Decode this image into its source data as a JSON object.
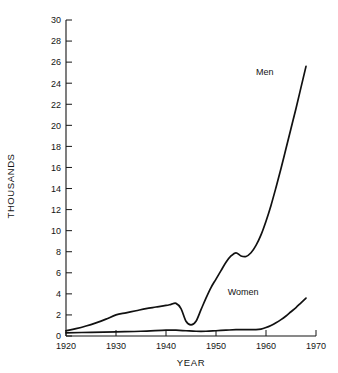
{
  "chart_data": {
    "type": "line",
    "title": "",
    "xlabel": "YEAR",
    "ylabel": "THOUSANDS",
    "xlim": [
      1920,
      1970
    ],
    "ylim": [
      0,
      30
    ],
    "grid": false,
    "legend_position": "inline-annotations",
    "xticks": [
      1920,
      1930,
      1940,
      1950,
      1960,
      1970
    ],
    "yticks": [
      0,
      2,
      4,
      6,
      8,
      10,
      12,
      14,
      16,
      18,
      20,
      22,
      24,
      26,
      28,
      30
    ],
    "xtick_labels": [
      "1920",
      "1930",
      "1940",
      "1950",
      "1960",
      "1970"
    ],
    "ytick_labels": [
      "0",
      "2",
      "4",
      "6",
      "8",
      "10",
      "12",
      "14",
      "16",
      "18",
      "20",
      "22",
      "24",
      "26",
      "28",
      "30"
    ],
    "annotations": [
      {
        "text": "Men",
        "x": 1961.5,
        "y": 24.8
      },
      {
        "text": "Women",
        "x": 1958.5,
        "y": 3.9
      }
    ],
    "series": [
      {
        "name": "Men",
        "x": [
          1920,
          1922,
          1924,
          1926,
          1928,
          1930,
          1932,
          1934,
          1936,
          1938,
          1940,
          1941,
          1942,
          1943,
          1944,
          1945,
          1946,
          1947,
          1948,
          1949,
          1950,
          1951,
          1952,
          1953,
          1954,
          1955,
          1956,
          1957,
          1958,
          1959,
          1960,
          1961,
          1962,
          1963,
          1964,
          1965,
          1966,
          1967,
          1968
        ],
        "values": [
          0.5,
          0.7,
          0.95,
          1.25,
          1.6,
          2.0,
          2.2,
          2.4,
          2.6,
          2.75,
          2.9,
          3.0,
          3.1,
          2.6,
          1.4,
          1.05,
          1.4,
          2.5,
          3.6,
          4.6,
          5.4,
          6.2,
          7.0,
          7.6,
          7.9,
          7.6,
          7.55,
          7.9,
          8.6,
          9.6,
          10.9,
          12.4,
          14.1,
          15.9,
          17.8,
          19.7,
          21.6,
          23.6,
          25.6
        ]
      },
      {
        "name": "Women",
        "x": [
          1920,
          1925,
          1930,
          1935,
          1940,
          1942,
          1944,
          1946,
          1948,
          1950,
          1952,
          1954,
          1956,
          1958,
          1959,
          1960,
          1961,
          1962,
          1963,
          1964,
          1965,
          1966,
          1967,
          1968
        ],
        "values": [
          0.3,
          0.35,
          0.4,
          0.45,
          0.55,
          0.55,
          0.5,
          0.45,
          0.45,
          0.5,
          0.55,
          0.6,
          0.6,
          0.6,
          0.65,
          0.8,
          1.0,
          1.25,
          1.55,
          1.9,
          2.3,
          2.7,
          3.15,
          3.6
        ]
      }
    ]
  }
}
